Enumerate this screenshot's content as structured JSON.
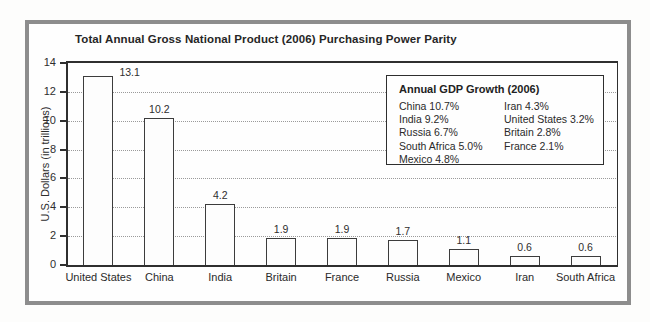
{
  "chart_data": {
    "type": "bar",
    "title": "Total Annual Gross National Product (2006) Purchasing Power Parity",
    "ylabel": "U.S. Dollars (in trillions)",
    "xlabel": "",
    "categories": [
      "United States",
      "China",
      "India",
      "Britain",
      "France",
      "Russia",
      "Mexico",
      "Iran",
      "South Africa"
    ],
    "values": [
      13.1,
      10.2,
      4.2,
      1.9,
      1.9,
      1.7,
      1.1,
      0.6,
      0.6
    ],
    "value_labels": [
      "13.1",
      "10.2",
      "4.2",
      "1.9",
      "1.9",
      "1.7",
      "1.1",
      "0.6",
      "0.6"
    ],
    "ylim": [
      0,
      14
    ],
    "yticks": [
      0,
      2,
      4,
      6,
      8,
      10,
      12,
      14
    ],
    "grid": "horizontal dotted lines at ticks 2-12",
    "growth_legend": {
      "title": "Annual GDP Growth (2006)",
      "position": "upper right",
      "col1": [
        "China 10.7%",
        "India 9.2%",
        "Russia 6.7%",
        "South Africa 5.0%",
        "Mexico 4.8%"
      ],
      "col2": [
        "Iran 4.3%",
        "United States 3.2%",
        "Britain 2.8%",
        "France 2.1%"
      ]
    },
    "colors": {
      "bar_fill": "#fdfdfd",
      "bar_border": "#3c3c3c",
      "gridline": "#9a9a9a",
      "axis": "#2f2f2f",
      "frame_border": "#8d8d8d",
      "text": "#2a2a2a"
    }
  }
}
